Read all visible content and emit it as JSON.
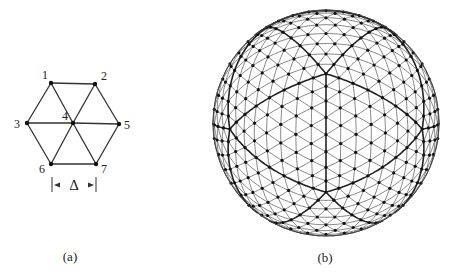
{
  "figure": {
    "panel_a": {
      "caption": "(a)",
      "nodes": [
        {
          "id": "1",
          "label": "1",
          "x": 51,
          "y": 83
        },
        {
          "id": "2",
          "label": "2",
          "x": 95,
          "y": 84
        },
        {
          "id": "3",
          "label": "3",
          "x": 27,
          "y": 123
        },
        {
          "id": "4",
          "label": "4",
          "x": 73,
          "y": 123
        },
        {
          "id": "5",
          "label": "5",
          "x": 119,
          "y": 124
        },
        {
          "id": "6",
          "label": "6",
          "x": 51,
          "y": 164
        },
        {
          "id": "7",
          "label": "7",
          "x": 96,
          "y": 164
        }
      ],
      "edges": [
        [
          "1",
          "2"
        ],
        [
          "2",
          "5"
        ],
        [
          "5",
          "7"
        ],
        [
          "7",
          "6"
        ],
        [
          "6",
          "3"
        ],
        [
          "3",
          "1"
        ],
        [
          "1",
          "4"
        ],
        [
          "2",
          "4"
        ],
        [
          "3",
          "4"
        ],
        [
          "5",
          "4"
        ],
        [
          "6",
          "4"
        ],
        [
          "7",
          "4"
        ]
      ],
      "spacing_label": "Δ"
    },
    "panel_b": {
      "caption": "(b)",
      "description": "Geodesic icosahedral grid on a sphere",
      "center": {
        "x": 326,
        "y": 123
      },
      "radius": 113,
      "subdivisions": 8
    },
    "colors": {
      "line": "#333333",
      "node": "#111111",
      "background": "#ffffff"
    }
  }
}
